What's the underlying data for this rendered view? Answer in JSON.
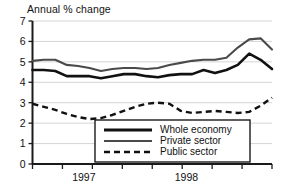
{
  "chart_data": {
    "type": "line",
    "title": "Annual % change",
    "xlabel": "",
    "ylabel": "",
    "ylim": [
      0,
      7
    ],
    "yticks": [
      0,
      1,
      2,
      3,
      4,
      5,
      6,
      7
    ],
    "ytick_labels": [
      "0",
      "1",
      "2",
      "3",
      "4",
      "5",
      "6",
      "7"
    ],
    "grid": true,
    "legend_position": "lower-center",
    "xtick_labels": [
      "1997",
      "1998"
    ],
    "x": [
      0,
      1,
      2,
      3,
      4,
      5,
      6,
      7,
      8,
      9,
      10,
      11,
      12,
      13,
      14,
      15,
      16,
      17,
      18,
      19,
      20,
      21
    ],
    "series": [
      {
        "name": "Whole economy",
        "style": "solid-thick",
        "color": "#111111",
        "values": [
          4.6,
          4.6,
          4.55,
          4.3,
          4.3,
          4.3,
          4.2,
          4.3,
          4.4,
          4.4,
          4.3,
          4.25,
          4.35,
          4.4,
          4.4,
          4.6,
          4.45,
          4.6,
          4.85,
          5.4,
          5.1,
          4.65
        ]
      },
      {
        "name": "Private sector",
        "style": "solid-medium",
        "color": "#4a4a4a",
        "values": [
          5.05,
          5.1,
          5.1,
          4.85,
          4.8,
          4.7,
          4.55,
          4.65,
          4.7,
          4.7,
          4.65,
          4.7,
          4.85,
          4.95,
          5.05,
          5.1,
          5.1,
          5.2,
          5.7,
          6.1,
          6.15,
          5.6
        ]
      },
      {
        "name": "Public sector",
        "style": "dashed",
        "color": "#111111",
        "values": [
          2.95,
          2.8,
          2.65,
          2.45,
          2.3,
          2.2,
          2.25,
          2.4,
          2.6,
          2.8,
          2.95,
          3.0,
          2.95,
          2.6,
          2.5,
          2.55,
          2.6,
          2.55,
          2.5,
          2.55,
          2.85,
          3.25
        ]
      }
    ],
    "axis": {
      "x_tick_count": 9,
      "year_label_positions": [
        4.5,
        13.5
      ]
    }
  },
  "legend": {
    "entries": [
      {
        "label": "Whole economy"
      },
      {
        "label": "Private sector"
      },
      {
        "label": "Public sector"
      }
    ]
  }
}
